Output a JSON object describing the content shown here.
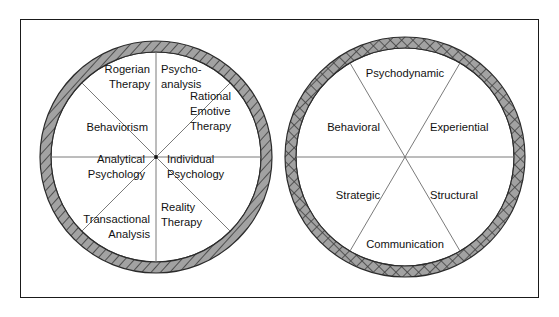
{
  "figure": {
    "background_color": "#ffffff",
    "frame_color": "#1a1a1a",
    "ring_fill_color": "#9d9d9d",
    "ring_hatch_color": "#3f3f3f",
    "spoke_color": "#6b6b6b",
    "text_color": "#111111"
  },
  "wheels": [
    {
      "id": "individual-therapies-wheel",
      "name": "Individual Therapies Wheel",
      "ring_pattern": "diagonal-hatch",
      "sector_count": 8,
      "center": {
        "x": 156,
        "y": 157
      },
      "outer_radius": 116,
      "ring_thickness": 11,
      "sectors": [
        {
          "index": 0,
          "label": "Psycho-\nanalysis",
          "lines": [
            "Psycho-",
            "analysis"
          ],
          "anchor": "start",
          "label_x": 161,
          "label_y": 78
        },
        {
          "index": 1,
          "label": "Rational Emotive Therapy",
          "lines": [
            "Rational",
            "Emotive",
            "Therapy"
          ],
          "anchor": "start",
          "label_x": 190,
          "label_y": 112
        },
        {
          "index": 2,
          "label": "Individual Psychology",
          "lines": [
            "Individual",
            "Psychology"
          ],
          "anchor": "start",
          "label_x": 167,
          "label_y": 168
        },
        {
          "index": 3,
          "label": "Reality Therapy",
          "lines": [
            "Reality",
            "Therapy"
          ],
          "anchor": "start",
          "label_x": 161,
          "label_y": 216
        },
        {
          "index": 4,
          "label": "Transactional Analysis",
          "lines": [
            "Transactional",
            "Analysis"
          ],
          "anchor": "end",
          "label_x": 150,
          "label_y": 228
        },
        {
          "index": 5,
          "label": "Analytical Psychology",
          "lines": [
            "Analytical",
            "Psychology"
          ],
          "anchor": "end",
          "label_x": 145,
          "label_y": 168
        },
        {
          "index": 6,
          "label": "Behaviorism",
          "lines": [
            "Behaviorism"
          ],
          "anchor": "end",
          "label_x": 148,
          "label_y": 128
        },
        {
          "index": 7,
          "label": "Rogerian Therapy",
          "lines": [
            "Rogerian",
            "Therapy"
          ],
          "anchor": "end",
          "label_x": 150,
          "label_y": 78
        }
      ]
    },
    {
      "id": "family-therapies-wheel",
      "name": "Family Therapies Wheel",
      "ring_pattern": "cross-hatch",
      "sector_count": 6,
      "center": {
        "x": 405,
        "y": 157
      },
      "outer_radius": 120,
      "ring_thickness": 11,
      "sectors": [
        {
          "index": 0,
          "label": "Experiential",
          "lines": [
            "Experiential"
          ],
          "anchor": "start",
          "label_x": 430,
          "label_y": 128
        },
        {
          "index": 1,
          "label": "Structural",
          "lines": [
            "Structural"
          ],
          "anchor": "start",
          "label_x": 430,
          "label_y": 196
        },
        {
          "index": 2,
          "label": "Communication",
          "lines": [
            "Communication"
          ],
          "anchor": "middle",
          "label_x": 405,
          "label_y": 245
        },
        {
          "index": 3,
          "label": "Strategic",
          "lines": [
            "Strategic"
          ],
          "anchor": "end",
          "label_x": 380,
          "label_y": 196
        },
        {
          "index": 4,
          "label": "Behavioral",
          "lines": [
            "Behavioral"
          ],
          "anchor": "end",
          "label_x": 380,
          "label_y": 128
        },
        {
          "index": 5,
          "label": "Psychodynamic",
          "lines": [
            "Psychodynamic"
          ],
          "anchor": "middle",
          "label_x": 405,
          "label_y": 74
        }
      ]
    }
  ]
}
